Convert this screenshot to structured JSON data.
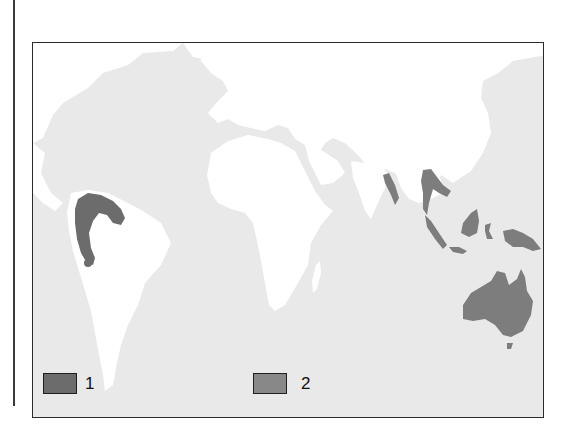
{
  "map": {
    "colors": {
      "ocean": "#e9e9e9",
      "land": "#ffffff",
      "category_1": "#6c6c6c",
      "category_2": "#7d7d7d",
      "frame": "#2a2a2a"
    },
    "highlighted_regions": [
      {
        "name": "Northwestern South America",
        "category": "1"
      },
      {
        "name": "Andean dot (Peru)",
        "category": "1"
      },
      {
        "name": "Myanmar / Andaman coast",
        "category": "2"
      },
      {
        "name": "Indochina / Malay Peninsula",
        "category": "2"
      },
      {
        "name": "Sumatra",
        "category": "2"
      },
      {
        "name": "Java",
        "category": "2"
      },
      {
        "name": "Borneo",
        "category": "2"
      },
      {
        "name": "Sulawesi",
        "category": "2"
      },
      {
        "name": "New Guinea",
        "category": "2"
      },
      {
        "name": "Australia",
        "category": "2"
      },
      {
        "name": "Tasmania",
        "category": "2"
      }
    ]
  },
  "legend": {
    "items": [
      {
        "label": "1",
        "color": "#6c6c6c"
      },
      {
        "label": "2",
        "color": "#888888"
      }
    ]
  }
}
